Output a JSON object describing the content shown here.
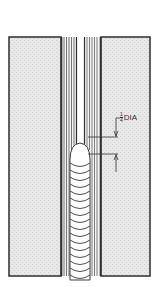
{
  "diagram": {
    "title": "",
    "type": "weld-joint-cross-section",
    "colors": {
      "plate_fill": "#e6e6e6",
      "outline": "#3a3a3a",
      "hatch": "#5a5a5a",
      "bead": "#ffffff"
    },
    "labels": {
      "dimension": {
        "fraction_numerator": "1",
        "fraction_denominator": "4",
        "text": "DIA"
      }
    },
    "bead_count": 17
  }
}
